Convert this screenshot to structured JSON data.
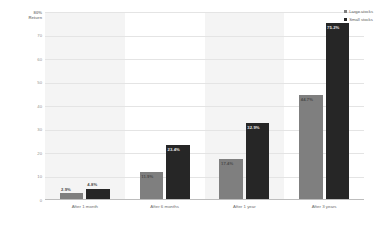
{
  "ghost_text": "",
  "legend": {
    "position": "top-right",
    "entries": [
      {
        "label": "Large stocks",
        "color": "#7f7f7f",
        "key": "large"
      },
      {
        "label": "Small stocks",
        "color": "#262626",
        "key": "small"
      }
    ]
  },
  "axis": {
    "y_title_line1": "80%",
    "y_title_line2": "Return",
    "ticks": [
      "70",
      "60",
      "50",
      "40",
      "30",
      "20",
      "10",
      "0"
    ]
  },
  "chart_data": {
    "type": "bar",
    "title": "",
    "subtitle": "",
    "xlabel": "",
    "ylabel": "Return",
    "ylim": [
      0,
      80
    ],
    "yticks": [
      0,
      10,
      20,
      30,
      40,
      50,
      60,
      70,
      80
    ],
    "grid": true,
    "legend_position": "top-right",
    "categories": [
      "After 1 month",
      "After 6 months",
      "After 1 year",
      "After 3 years"
    ],
    "series": [
      {
        "name": "Large stocks",
        "color": "#7f7f7f",
        "values": [
          2.9,
          11.9,
          17.4,
          44.7
        ],
        "labels": [
          "2.9%",
          "11.9%",
          "17.4%",
          "44.7%"
        ]
      },
      {
        "name": "Small stocks",
        "color": "#262626",
        "values": [
          4.8,
          23.4,
          32.9,
          75.2
        ],
        "labels": [
          "4.8%",
          "23.4%",
          "32.9%",
          "75.2%"
        ]
      }
    ]
  }
}
